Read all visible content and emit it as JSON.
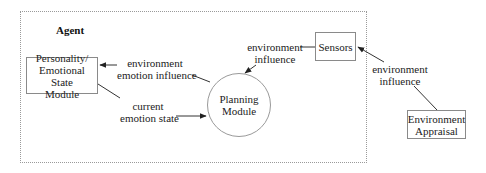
{
  "diagram": {
    "container": {
      "title": "Agent"
    },
    "nodes": {
      "personality": {
        "line1": "Personality/",
        "line2": "Emotional State",
        "line3": "Module"
      },
      "planning": {
        "line1": "Planning",
        "line2": "Module"
      },
      "sensors": {
        "line1": "Sensors"
      },
      "environment_appraisal": {
        "line1": "Environment",
        "line2": "Appraisal"
      }
    },
    "edges": {
      "planning_to_personality": {
        "line1": "environment",
        "line2": "emotion influence"
      },
      "personality_to_planning": {
        "line1": "current",
        "line2": "emotion state"
      },
      "sensors_to_planning": {
        "line1": "environment",
        "line2": "influence"
      },
      "appraisal_to_sensors": {
        "line1": "environment",
        "line2": "influence"
      }
    },
    "colors": {
      "line": "#333333",
      "node_border": "#8a8a8a",
      "frame_border": "#9a9a9a"
    }
  }
}
